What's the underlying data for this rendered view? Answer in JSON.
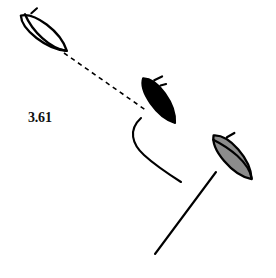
{
  "figure": {
    "background_color": "#ffffff",
    "stroke_color": "#000000",
    "title": "",
    "measurement_label": "3.61",
    "label_units": "",
    "specimens": [
      {
        "id": "specimen-outline",
        "name": "unfilled-spindle-top-left",
        "fill": "#ffffff",
        "fill_name": "white",
        "stroke": "#000000",
        "has_tail": false,
        "has_apex_tip": true,
        "has_internal_ridge": true,
        "center_x": 44,
        "center_y": 33,
        "length": 58,
        "width": 20,
        "angle_deg": 37
      },
      {
        "id": "specimen-filled",
        "name": "solid-black-spindle-center",
        "fill": "#000000",
        "fill_name": "black",
        "stroke": "#000000",
        "has_tail": true,
        "tail_style": "curved",
        "has_apex_tip": true,
        "has_internal_ridge": false,
        "center_x": 158,
        "center_y": 100,
        "length": 52,
        "width": 22,
        "angle_deg": 55
      },
      {
        "id": "specimen-shaded",
        "name": "gray-shaded-spindle-bottom-right",
        "fill": "#8c8c8c",
        "fill_name": "gray",
        "stroke": "#000000",
        "has_tail": true,
        "tail_style": "straight",
        "has_apex_tip": true,
        "has_internal_ridge": true,
        "center_x": 232,
        "center_y": 157,
        "length": 56,
        "width": 22,
        "angle_deg": 50
      }
    ],
    "connector": {
      "name": "dashed-measurement-line",
      "style": "dashed",
      "color": "#000000",
      "from_x": 63,
      "from_y": 52,
      "to_x": 146,
      "to_y": 110,
      "dash_pattern": "4 4",
      "value": "3.61"
    },
    "tails": [
      {
        "name": "curved-tail-center-specimen",
        "path": "M 140 117 C 129 131, 138 146, 151 158 C 160 167, 170 174, 180 181",
        "color": "#000000"
      },
      {
        "name": "straight-tail-right-specimen",
        "path": "M 214 173 L 156 253",
        "color": "#000000"
      }
    ]
  }
}
